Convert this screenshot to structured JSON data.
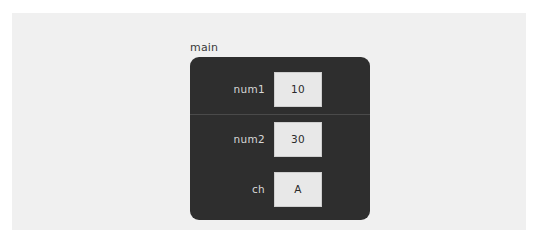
{
  "canvas": {
    "page_background": "#ffffff",
    "card_background": "#f0f0f0",
    "panel_background": "#2e2e2e",
    "panel_divider_color": "#4a4a4a",
    "value_box_background": "#e8e8e8",
    "value_box_border": "#cfcfcf",
    "label_color": "#d8d8d8",
    "value_color": "#2a2a2a",
    "caption_color": "#3a3a3a"
  },
  "panel": {
    "caption": "main",
    "rows": [
      {
        "label": "num1",
        "value": "10",
        "divider_below": true
      },
      {
        "label": "num2",
        "value": "30",
        "divider_below": false
      },
      {
        "label": "ch",
        "value": "A",
        "divider_below": false
      }
    ]
  }
}
